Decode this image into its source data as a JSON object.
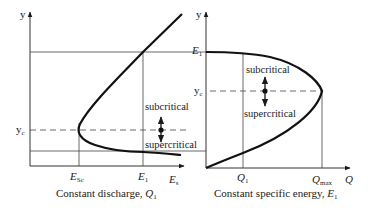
{
  "left_panel": {
    "y_axis_label": "y",
    "x_axis_label": "E",
    "x_axis_label_sub": "s",
    "yc_label": "y",
    "yc_label_sub": "c",
    "esc_label": "E",
    "esc_label_sub": "Sc",
    "e1_label": "E",
    "e1_label_sub": "1",
    "subcritical_label": "subcritical",
    "supercritical_label": "supercritical",
    "caption": "Constant discharge, ",
    "caption_var": "Q",
    "caption_var_sub": "1"
  },
  "right_panel": {
    "y_axis_label": "y",
    "x_axis_label": "Q",
    "e1_label": "E",
    "e1_label_sub": "1",
    "yc_label": "y",
    "yc_label_sub": "c",
    "q1_label": "Q",
    "q1_label_sub": "1",
    "qmax_label": "Q",
    "qmax_label_sub": "max",
    "subcritical_label": "subcritical",
    "supercritical_label": "supercritical",
    "caption": "Constant specific energy, ",
    "caption_var": "E",
    "caption_var_sub": "1"
  },
  "colors": {
    "line": "#1a1a1a",
    "thin_line": "#444444",
    "background": "#ffffff"
  }
}
